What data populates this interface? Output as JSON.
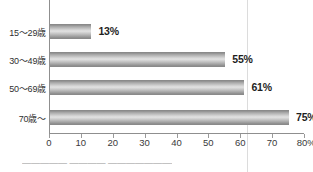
{
  "chart_data": {
    "type": "bar",
    "orientation": "horizontal",
    "title": "",
    "xlabel": "",
    "ylabel": "",
    "categories": [
      "15〜29歳",
      "30〜49歳",
      "50〜69歳",
      "70歳〜"
    ],
    "values": [
      13,
      55,
      61,
      75
    ],
    "value_labels": [
      "13%",
      "55%",
      "61%",
      "75%"
    ],
    "xlim": [
      0,
      80
    ],
    "xticks": [
      0,
      10,
      20,
      30,
      40,
      50,
      60,
      70,
      80
    ],
    "xtick_labels": [
      "0",
      "10",
      "20",
      "30",
      "40",
      "50",
      "60",
      "70",
      "80%"
    ],
    "grid": false,
    "legend": null,
    "series": [
      {
        "name": "",
        "values": [
          13,
          55,
          61,
          75
        ]
      }
    ],
    "colors": {
      "bar_light": "#e2e2e2",
      "bar_mid": "#cfcfcf",
      "bar_dark": "#8a8a8a",
      "axis": "#8f8f8f",
      "text": "#2f2f2f",
      "value_text": "#1e1e1e",
      "artifact_line": "#dcdcdc"
    }
  },
  "artifacts": {
    "bottom_cropped_text": "▬▬▬▬▬ ▬▬▬▬ ▬▬▬▬▬▬▬▬"
  }
}
